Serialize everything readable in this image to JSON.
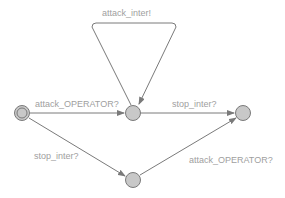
{
  "diagram": {
    "type": "timed-automaton",
    "colors": {
      "node_fill": "#c8c8c8",
      "edge": "#7a7a7a",
      "label": "#a0a0a0",
      "background": "#ffffff"
    },
    "nodes": [
      {
        "id": "init",
        "initial": true
      },
      {
        "id": "mid",
        "initial": false
      },
      {
        "id": "right",
        "initial": false
      },
      {
        "id": "bottom",
        "initial": false
      }
    ],
    "edges": [
      {
        "from": "mid",
        "to": "mid",
        "label": "attack_inter!"
      },
      {
        "from": "init",
        "to": "mid",
        "label": "attack_OPERATOR?"
      },
      {
        "from": "mid",
        "to": "right",
        "label": "stop_inter?"
      },
      {
        "from": "init",
        "to": "bottom",
        "label": "stop_inter?"
      },
      {
        "from": "bottom",
        "to": "right",
        "label": "attack_OPERATOR?"
      }
    ]
  }
}
